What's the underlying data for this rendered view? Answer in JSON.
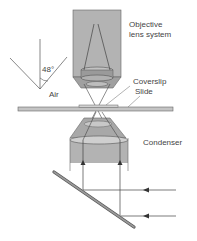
{
  "diagram": {
    "labels": {
      "objective_line1": "Objective",
      "objective_line2": "lens system",
      "angle": "48°",
      "medium": "Air",
      "coverslip": "Coverslip",
      "slide": "Slide",
      "condenser": "Condenser"
    },
    "colors": {
      "body_fill": "#b3b3b3",
      "body_fill_light": "#d0d0d0",
      "lens_fill": "#a6a6a6",
      "stroke": "#555555",
      "slide_fill": "#c4c4c4",
      "mirror_fill": "#8c8c8c",
      "text": "#444444"
    }
  }
}
